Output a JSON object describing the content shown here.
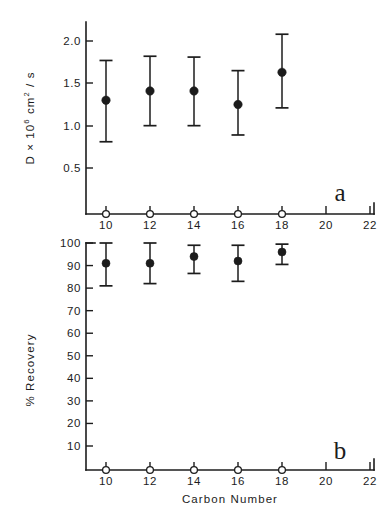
{
  "figure": {
    "title": "",
    "background_color": "#ffffff",
    "ink_color": "#1c1c1c"
  },
  "panel_a": {
    "letter": "a",
    "ylabel_parts": {
      "lead": "D × 10",
      "exponent": "6",
      "tail": " cm",
      "tail_exponent": "2",
      "tail_end": " / s"
    },
    "ylabel_full": "D × 10⁶ cm² / s",
    "ytick_labels": [
      "2.0",
      "1.5",
      "1.0",
      "0.5"
    ],
    "xtick_labels": [
      "10",
      "12",
      "14",
      "16",
      "18",
      "20",
      "22"
    ]
  },
  "panel_b": {
    "letter": "b",
    "ylabel": "% Recovery",
    "ytick_labels": [
      "100",
      "90",
      "80",
      "70",
      "60",
      "50",
      "40",
      "30",
      "20",
      "10"
    ],
    "xtick_labels": [
      "10",
      "12",
      "14",
      "16",
      "18",
      "20",
      "22"
    ],
    "xlabel": "Carbon Number"
  },
  "chart_data": [
    {
      "type": "scatter",
      "panel": "a",
      "title": "",
      "xlabel": "Carbon Number",
      "ylabel": "D × 10⁶ cm² / s",
      "xlim": [
        9,
        22
      ],
      "ylim": [
        0,
        2.2
      ],
      "xticks": [
        10,
        12,
        14,
        16,
        18,
        20,
        22
      ],
      "yticks": [
        0.5,
        1.0,
        1.5,
        2.0
      ],
      "grid": false,
      "legend": false,
      "marker": "filled-circle",
      "errorbars": true,
      "x": [
        10,
        12,
        14,
        16,
        18
      ],
      "values": [
        1.3,
        1.41,
        1.41,
        1.25,
        1.63
      ],
      "err_low": [
        0.81,
        1.0,
        1.0,
        0.89,
        1.21
      ],
      "err_high": [
        1.77,
        1.82,
        1.81,
        1.65,
        2.08
      ],
      "baseline_markers": {
        "marker": "open-circle",
        "x": [
          10,
          12,
          14,
          16,
          18
        ],
        "y": 0
      }
    },
    {
      "type": "scatter",
      "panel": "b",
      "title": "",
      "xlabel": "Carbon Number",
      "ylabel": "% Recovery",
      "xlim": [
        9,
        22
      ],
      "ylim": [
        0,
        104
      ],
      "xticks": [
        10,
        12,
        14,
        16,
        18,
        20,
        22
      ],
      "yticks": [
        10,
        20,
        30,
        40,
        50,
        60,
        70,
        80,
        90,
        100
      ],
      "grid": false,
      "legend": false,
      "marker": "filled-circle",
      "errorbars": true,
      "x": [
        10,
        12,
        14,
        16,
        18
      ],
      "values": [
        91,
        91,
        94,
        92,
        96
      ],
      "err_low": [
        81,
        82,
        86.5,
        83,
        90.5
      ],
      "err_high": [
        100,
        100,
        99,
        99,
        99.5
      ],
      "baseline_markers": {
        "marker": "open-circle",
        "x": [
          10,
          12,
          14,
          16,
          18
        ],
        "y": 0
      }
    }
  ]
}
